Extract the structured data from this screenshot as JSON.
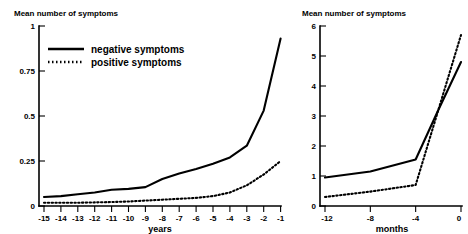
{
  "chart_data": [
    {
      "type": "line",
      "panel": "left",
      "title": "Mean number of symptoms",
      "xlabel": "years",
      "ylabel": "",
      "xlim": [
        -15.6,
        -0.6
      ],
      "ylim": [
        0,
        1
      ],
      "grid": false,
      "legend_position": "top-left inside plot",
      "ytick_labels": [
        "0",
        "0.25",
        "0.5",
        "0.75",
        "1"
      ],
      "ytick_values": [
        0,
        0.25,
        0.5,
        0.75,
        1
      ],
      "xtick_labels": [
        "-15",
        "-14",
        "-13",
        "-12",
        "-11",
        "-10",
        "-9",
        "-8",
        "-7",
        "-6",
        "-5",
        "-4",
        "-3",
        "-2",
        "-1"
      ],
      "xtick_values": [
        -15,
        -14,
        -13,
        -12,
        -11,
        -10,
        -9,
        -8,
        -7,
        -6,
        -5,
        -4,
        -3,
        -2,
        -1
      ],
      "x": [
        -15,
        -14,
        -13,
        -12,
        -11,
        -10,
        -9,
        -8,
        -7,
        -6,
        -5,
        -4,
        -3,
        -2,
        -1
      ],
      "series": [
        {
          "name": "negative symptoms",
          "style": "solid",
          "values": [
            0.05,
            0.055,
            0.065,
            0.075,
            0.09,
            0.095,
            0.105,
            0.15,
            0.18,
            0.205,
            0.235,
            0.27,
            0.335,
            0.53,
            0.93
          ]
        },
        {
          "name": "positive symptoms",
          "style": "dotted",
          "values": [
            0.018,
            0.018,
            0.018,
            0.02,
            0.022,
            0.025,
            0.03,
            0.035,
            0.04,
            0.045,
            0.055,
            0.075,
            0.115,
            0.175,
            0.25
          ]
        }
      ]
    },
    {
      "type": "line",
      "panel": "right",
      "title": "Mean number of symptoms",
      "xlabel": "months",
      "ylabel": "",
      "xlim": [
        -12.6,
        0.6
      ],
      "ylim": [
        0,
        6
      ],
      "grid": false,
      "legend_position": "none",
      "ytick_labels": [
        "0",
        "1",
        "2",
        "3",
        "4",
        "5",
        "6"
      ],
      "ytick_values": [
        0,
        1,
        2,
        3,
        4,
        5,
        6
      ],
      "xtick_labels": [
        "-12",
        "-8",
        "-4",
        "0"
      ],
      "xtick_values": [
        -12,
        -8,
        -4,
        0
      ],
      "x": [
        -12,
        -8,
        -4,
        -2,
        0
      ],
      "series": [
        {
          "name": "negative symptoms",
          "style": "solid",
          "values": [
            0.95,
            1.15,
            1.55,
            3.2,
            4.8
          ]
        },
        {
          "name": "positive symptoms",
          "style": "dotted",
          "values": [
            0.3,
            0.48,
            0.7,
            3.2,
            5.7
          ]
        }
      ]
    }
  ],
  "left_panel": {
    "title": "Mean number of symptoms",
    "axis_name": "years",
    "legend": [
      {
        "label": "negative symptoms",
        "style": "solid"
      },
      {
        "label": "positive symptoms",
        "style": "dotted"
      }
    ],
    "ytick_labels": [
      "1",
      "0.75",
      "0.5",
      "0.25",
      "0"
    ],
    "xtick_labels": [
      "-15",
      "-14",
      "-13",
      "-12",
      "-11",
      "-10",
      "-9",
      "-8",
      "-7",
      "-6",
      "-5",
      "-4",
      "-3",
      "-2",
      "-1"
    ]
  },
  "right_panel": {
    "title": "Mean number of symptoms",
    "axis_name": "months",
    "ytick_labels": [
      "6",
      "5",
      "4",
      "3",
      "2",
      "1",
      "0"
    ],
    "xtick_labels": [
      "-12",
      "-8",
      "-4",
      "0"
    ]
  },
  "colors": {
    "ink": "#000000",
    "background": "#ffffff"
  }
}
